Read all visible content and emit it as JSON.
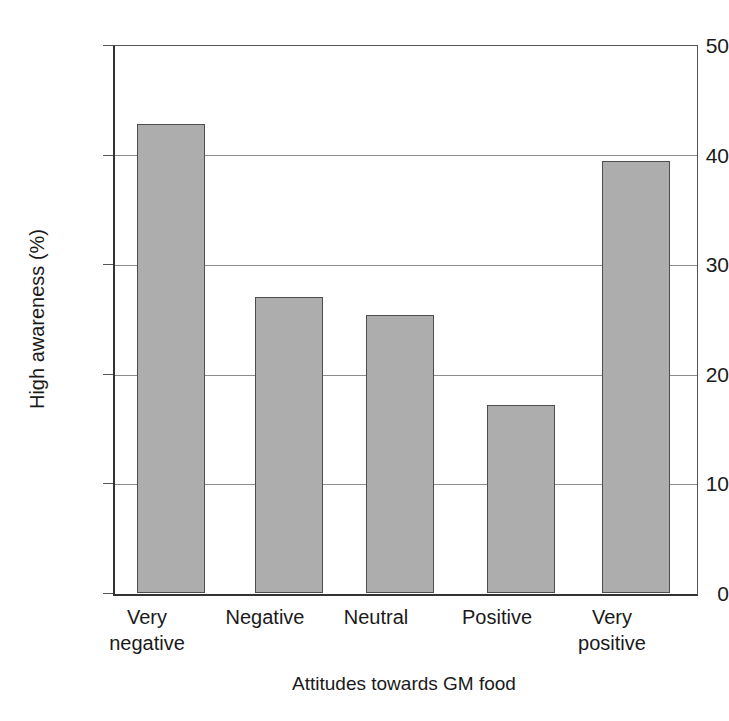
{
  "chart_data": {
    "type": "bar",
    "title": "",
    "xlabel": "Attitudes towards GM food",
    "ylabel": "High awareness (%)",
    "categories": [
      "Very\nnegative",
      "Negative",
      "Neutral",
      "Positive",
      "Very\npositive"
    ],
    "values": [
      42.8,
      27.0,
      25.4,
      17.2,
      39.4
    ],
    "ylim": [
      0,
      50
    ],
    "yticks": [
      0,
      10,
      20,
      30,
      40,
      50
    ],
    "ytick_labels": [
      "0",
      "10",
      "20",
      "30",
      "40",
      "50"
    ],
    "grid": "horizontal",
    "legend": "none",
    "bar_fill_color": "#adadad",
    "bar_edge_color": "#4d4d4d",
    "axis_color": "#333333",
    "grid_color": "#8c8c8c",
    "background_color": "#ffffff"
  },
  "axes": {
    "y_title": "High awareness (%)",
    "x_title": "Attitudes towards GM food"
  }
}
